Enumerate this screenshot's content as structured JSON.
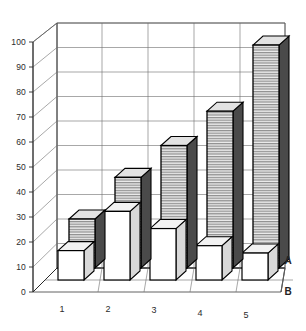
{
  "chart_data": {
    "type": "bar",
    "title": "",
    "subtitle": "",
    "xlabel": "",
    "ylabel": "",
    "categories": [
      "1",
      "2",
      "3",
      "4",
      "5"
    ],
    "ylim": [
      0,
      100
    ],
    "ytick_labels": [
      "0",
      "10",
      "20",
      "30",
      "40",
      "50",
      "60",
      "70",
      "80",
      "90",
      "100"
    ],
    "ytick_values": [
      0,
      10,
      20,
      30,
      40,
      50,
      60,
      70,
      80,
      90,
      100
    ],
    "grid": true,
    "legend_position": "right-depth-axis",
    "three_d": true,
    "series": [
      {
        "name": "A",
        "values": [
          20,
          37,
          50,
          64,
          91
        ],
        "fill": "hatched-gray",
        "color": "#9a9a9a"
      },
      {
        "name": "B",
        "values": [
          12,
          28,
          21,
          14,
          11
        ],
        "fill": "solid-white",
        "color": "#ffffff"
      }
    ]
  },
  "axis": {
    "y_ticks": [
      {
        "label": "100",
        "value": 100
      },
      {
        "label": "90",
        "value": 90
      },
      {
        "label": "80",
        "value": 80
      },
      {
        "label": "70",
        "value": 70
      },
      {
        "label": "60",
        "value": 60
      },
      {
        "label": "50",
        "value": 50
      },
      {
        "label": "40",
        "value": 40
      },
      {
        "label": "30",
        "value": 30
      },
      {
        "label": "20",
        "value": 20
      },
      {
        "label": "10",
        "value": 10
      },
      {
        "label": "0",
        "value": 0
      }
    ],
    "x_ticks": [
      {
        "label": "1"
      },
      {
        "label": "2"
      },
      {
        "label": "3"
      },
      {
        "label": "4"
      },
      {
        "label": "5"
      }
    ],
    "depth_labels": [
      {
        "label": "A"
      },
      {
        "label": "B"
      }
    ]
  },
  "colors": {
    "grid": "#6d6d6d",
    "axis": "#2a2a2a",
    "bar_a_fill": "#9a9a9a",
    "bar_b_fill": "#ffffff",
    "text": "#2b2b2b",
    "background": "#ffffff"
  }
}
